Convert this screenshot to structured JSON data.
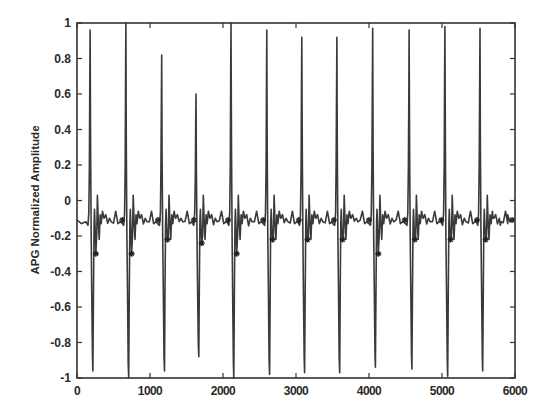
{
  "chart_data": {
    "type": "line",
    "title": "",
    "xlabel": "",
    "ylabel": "APG Normalized Amplitude",
    "xlim": [
      0,
      6000
    ],
    "ylim": [
      -1,
      1
    ],
    "x_ticks": [
      0,
      1000,
      2000,
      3000,
      4000,
      5000,
      6000
    ],
    "x_tick_labels": [
      "0",
      "1000",
      "2000",
      "3000",
      "4000",
      "5000",
      "6000"
    ],
    "y_ticks": [
      -1,
      -0.8,
      -0.6,
      -0.4,
      -0.2,
      0,
      0.2,
      0.4,
      0.6,
      0.8,
      1
    ],
    "y_tick_labels": [
      "-1",
      "-0.8",
      "-0.6",
      "-0.4",
      "-0.2",
      "0",
      "0.2",
      "0.4",
      "0.6",
      "0.8",
      "1"
    ],
    "grid": false,
    "legend": null,
    "baseline": -0.12,
    "series": [
      {
        "name": "APG signal",
        "color": "#3a3a3a",
        "beats": [
          {
            "peak_x": 180,
            "peak_y": 0.96,
            "trough_y": -0.96,
            "marker_y": -0.3
          },
          {
            "peak_x": 670,
            "peak_y": 1.0,
            "trough_y": -1.0,
            "marker_y": -0.3
          },
          {
            "peak_x": 1160,
            "peak_y": 0.82,
            "trough_y": -0.96,
            "marker_y": -0.22
          },
          {
            "peak_x": 1630,
            "peak_y": 0.6,
            "trough_y": -0.88,
            "marker_y": -0.24
          },
          {
            "peak_x": 2110,
            "peak_y": 1.0,
            "trough_y": -1.0,
            "marker_y": -0.3
          },
          {
            "peak_x": 2600,
            "peak_y": 0.96,
            "trough_y": -0.98,
            "marker_y": -0.22
          },
          {
            "peak_x": 3080,
            "peak_y": 0.92,
            "trough_y": -0.97,
            "marker_y": -0.22
          },
          {
            "peak_x": 3560,
            "peak_y": 0.92,
            "trough_y": -0.97,
            "marker_y": -0.22
          },
          {
            "peak_x": 4050,
            "peak_y": 0.97,
            "trough_y": -0.94,
            "marker_y": -0.3
          },
          {
            "peak_x": 4550,
            "peak_y": 0.96,
            "trough_y": -0.95,
            "marker_y": -0.22
          },
          {
            "peak_x": 5040,
            "peak_y": 0.98,
            "trough_y": -0.99,
            "marker_y": -0.22
          },
          {
            "peak_x": 5520,
            "peak_y": 0.97,
            "trough_y": -0.96,
            "marker_y": -0.22
          }
        ]
      }
    ],
    "annotations": "star markers at secondary minima after each systolic trough and at small notch before each peak"
  }
}
